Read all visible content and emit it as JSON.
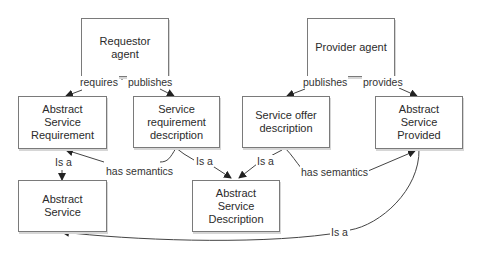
{
  "diagram": {
    "type": "concept-relationship",
    "colors": {
      "box_border": "#7a7a7a",
      "line": "#333333",
      "text": "#2b2b2b",
      "background": "#ffffff"
    },
    "nodes": [
      {
        "id": "requestor_agent",
        "label": "Requestor agent"
      },
      {
        "id": "provider_agent",
        "label": "Provider agent"
      },
      {
        "id": "abstract_service_requirement",
        "label": "Abstract Service Requirement"
      },
      {
        "id": "service_requirement_description",
        "label": "Service requirement description"
      },
      {
        "id": "service_offer_description",
        "label": "Service offer description"
      },
      {
        "id": "abstract_service_provided",
        "label": "Abstract Service Provided"
      },
      {
        "id": "abstract_service",
        "label": "Abstract Service"
      },
      {
        "id": "abstract_service_description",
        "label": "Abstract Service Description"
      }
    ],
    "edges": [
      {
        "from": "requestor_agent",
        "to": "abstract_service_requirement",
        "label": "requires"
      },
      {
        "from": "requestor_agent",
        "to": "service_requirement_description",
        "label": "publishes"
      },
      {
        "from": "provider_agent",
        "to": "service_offer_description",
        "label": "publishes"
      },
      {
        "from": "provider_agent",
        "to": "abstract_service_provided",
        "label": "provides"
      },
      {
        "from": "abstract_service_requirement",
        "to": "abstract_service",
        "label": "Is a"
      },
      {
        "from": "service_requirement_description",
        "to": "abstract_service_requirement",
        "label": "has semantics"
      },
      {
        "from": "service_requirement_description",
        "to": "abstract_service_description",
        "label": "Is a"
      },
      {
        "from": "service_offer_description",
        "to": "abstract_service_description",
        "label": "Is a"
      },
      {
        "from": "service_offer_description",
        "to": "abstract_service_provided",
        "label": "has semantics"
      },
      {
        "from": "abstract_service_provided",
        "to": "abstract_service",
        "label": "Is a"
      }
    ]
  }
}
